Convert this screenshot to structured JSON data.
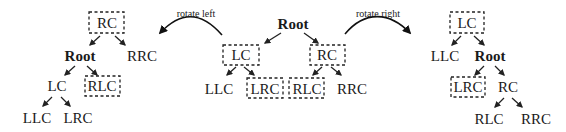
{
  "diagram": {
    "title": "",
    "arrows": {
      "left": {
        "label": "rotate left"
      },
      "right": {
        "label": "rotate right"
      }
    },
    "trees": {
      "left": {
        "description": "After rotate left",
        "nodes": {
          "rc": {
            "label": "RC",
            "highlighted": true
          },
          "root": {
            "label": "Root",
            "bold": true
          },
          "rrc": {
            "label": "RRC"
          },
          "lc": {
            "label": "LC"
          },
          "rlc": {
            "label": "RLC",
            "highlighted": true
          },
          "llc": {
            "label": "LLC"
          },
          "lrc": {
            "label": "LRC"
          }
        }
      },
      "center": {
        "description": "Original tree",
        "nodes": {
          "root": {
            "label": "Root",
            "bold": true
          },
          "lc": {
            "label": "LC",
            "highlighted": true
          },
          "rc": {
            "label": "RC",
            "highlighted": true
          },
          "llc": {
            "label": "LLC"
          },
          "lrc": {
            "label": "LRC",
            "highlighted": true
          },
          "rlc": {
            "label": "RLC",
            "highlighted": true
          },
          "rrc": {
            "label": "RRC"
          }
        }
      },
      "right": {
        "description": "After rotate right",
        "nodes": {
          "lc": {
            "label": "LC",
            "highlighted": true
          },
          "llc": {
            "label": "LLC"
          },
          "root": {
            "label": "Root",
            "bold": true
          },
          "lrc": {
            "label": "LRC",
            "highlighted": true
          },
          "rc": {
            "label": "RC"
          },
          "rlc": {
            "label": "RLC"
          },
          "rrc": {
            "label": "RRC"
          }
        }
      }
    }
  }
}
